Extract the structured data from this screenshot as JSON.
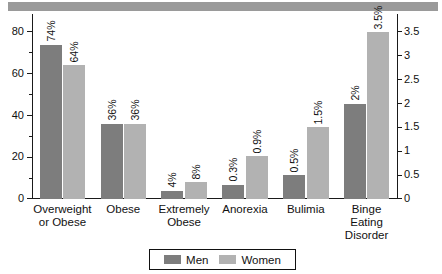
{
  "banner": {
    "color": "#9a9a9a"
  },
  "legend": {
    "position": "bottom-center",
    "entries": [
      {
        "label": "Men",
        "color": "#7d7d7d"
      },
      {
        "label": "Women",
        "color": "#b2b2b2"
      }
    ]
  },
  "axes": {
    "left_ticks": [
      "0",
      "20",
      "40",
      "60",
      "80"
    ],
    "left_minor_ticks": [
      "10",
      "30",
      "50",
      "70"
    ],
    "right_ticks": [
      "0",
      "0.5",
      "1",
      "1.5",
      "2",
      "2.5",
      "3",
      "3.5"
    ]
  },
  "chart_data": {
    "type": "bar",
    "title": "",
    "xlabel": "",
    "ylabel": "",
    "ylim": [
      0,
      80
    ],
    "y2lim": [
      0,
      3.5
    ],
    "grid": false,
    "legend_position": "bottom-center",
    "categories": [
      "Overweight\nor Obese",
      "Obese",
      "Extremely\nObese",
      "Anorexia",
      "Bulimia",
      "Binge Eating\nDisorder"
    ],
    "category_axis": [
      "left",
      "left",
      "left",
      "right",
      "right",
      "right"
    ],
    "series": [
      {
        "name": "Men",
        "color": "#7d7d7d",
        "values": [
          74,
          36,
          4,
          0.3,
          0.5,
          2
        ],
        "labels": [
          "74%",
          "36%",
          "4%",
          "0.3%",
          "0.5%",
          "2%"
        ]
      },
      {
        "name": "Women",
        "color": "#b2b2b2",
        "values": [
          64,
          36,
          8,
          0.9,
          1.5,
          3.5
        ],
        "labels": [
          "64%",
          "36%",
          "8%",
          "0.9%",
          "1.5%",
          "3.5%"
        ]
      }
    ]
  }
}
